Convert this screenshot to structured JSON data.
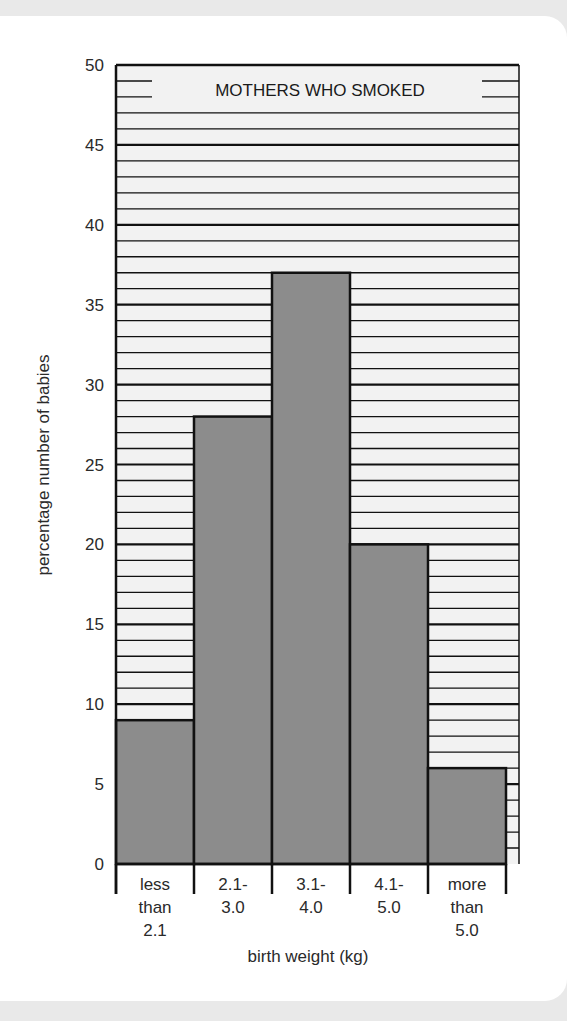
{
  "chart_data": {
    "type": "bar",
    "title": "MOTHERS WHO SMOKED",
    "xlabel": "birth weight (kg)",
    "ylabel": "percentage number of babies",
    "categories": [
      [
        "less",
        "than",
        "2.1"
      ],
      [
        "2.1-",
        "3.0"
      ],
      [
        "3.1-",
        "4.0"
      ],
      [
        "4.1-",
        "5.0"
      ],
      [
        "more",
        "than",
        "5.0"
      ]
    ],
    "category_names": [
      "less than 2.1",
      "2.1-3.0",
      "3.1-4.0",
      "4.1-5.0",
      "more than 5.0"
    ],
    "values": [
      9,
      28,
      37,
      20,
      6
    ],
    "ylim": [
      0,
      50
    ],
    "yticks": [
      0,
      5,
      10,
      15,
      20,
      25,
      30,
      35,
      40,
      45,
      50
    ],
    "grid": {
      "minor_step": 1,
      "major_step": 5
    },
    "legend": "none",
    "bar_color": "#8c8c8c",
    "grid_bg": "#f2f2f2",
    "line_color": "#111111"
  }
}
